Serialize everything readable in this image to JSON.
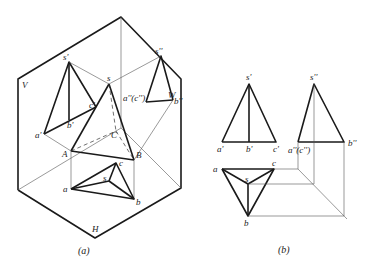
{
  "figure_a": {
    "caption": "(a)",
    "planes": {
      "V": "V",
      "W": "W",
      "H": "H"
    },
    "points": {
      "s_prime": "s'",
      "a_prime": "a'",
      "b_prime": "b'",
      "c_prime": "c'",
      "s_dprime": "s''",
      "a_dprime_c_dprime": "a''(c'')",
      "b_dprime": "b''",
      "S": "s",
      "A": "A",
      "B": "B",
      "C": "C",
      "s": "s",
      "a": "a",
      "b": "b",
      "c": "c"
    }
  },
  "figure_b": {
    "caption": "(b)",
    "points": {
      "s_prime": "s'",
      "a_prime": "a'",
      "b_prime": "b'",
      "c_prime": "c'",
      "s_dprime": "s''",
      "a_dprime_c_dprime": "a''(c'')",
      "b_dprime": "b''",
      "s": "s",
      "a": "a",
      "b": "b",
      "c": "c"
    }
  }
}
